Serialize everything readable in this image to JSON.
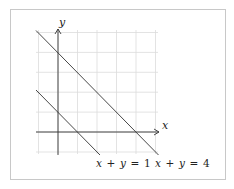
{
  "diagram": {
    "type": "coordinate-plane",
    "frame": {
      "border_color": "#c8c8c8",
      "background": "#ffffff"
    },
    "grid": {
      "color": "#dcdcdc",
      "x_range": [
        -1,
        5
      ],
      "y_range": [
        -1,
        5
      ],
      "step": 1
    },
    "axes": {
      "color": "#333333",
      "x_label": "x",
      "y_label": "y"
    },
    "lines": [
      {
        "id": "line1",
        "equation": "x + y = 1",
        "label_parts": [
          "x",
          "+",
          "y",
          "=",
          "1"
        ],
        "color": "#333333"
      },
      {
        "id": "line4",
        "equation": "x + y = 4",
        "label_parts": [
          "x",
          "+",
          "y",
          "=",
          "4"
        ],
        "color": "#333333"
      }
    ]
  }
}
